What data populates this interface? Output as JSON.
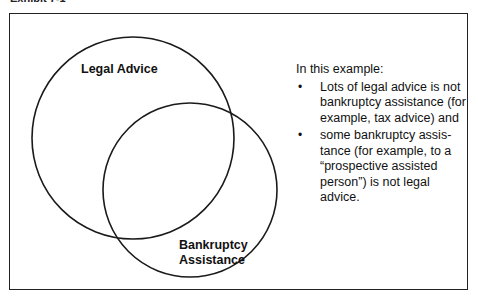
{
  "caption": "Exhibit 7-1",
  "venn": {
    "sets": [
      {
        "name": "Legal Advice",
        "cx": 133,
        "cy": 138,
        "r": 101
      },
      {
        "name": "Bankruptcy Assistance",
        "cx": 190,
        "cy": 190,
        "r": 87
      }
    ],
    "labels": {
      "legal_advice": "Legal Advice",
      "bankruptcy_line1": "Bankruptcy",
      "bankruptcy_line2": "Assistance"
    },
    "stroke_color": "#1a1a1a"
  },
  "notes": {
    "intro": "In this example:",
    "bullets": [
      {
        "symbol": "•",
        "text": "Lots of legal advice is not bankruptcy assistance (for example, tax advice) and"
      },
      {
        "symbol": "•",
        "text": "some bankruptcy assis-tance (for example, to a “prospective assisted person”) is not legal advice."
      }
    ]
  }
}
